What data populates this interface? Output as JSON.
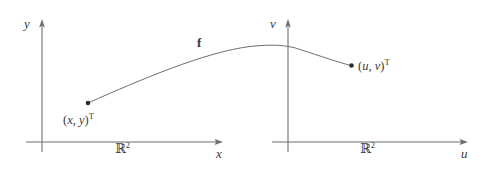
{
  "figure": {
    "type": "math-diagram",
    "title_text": "",
    "background_color": "#ffffff",
    "stroke_color": "#6e6e6e",
    "text_color": "#3a3a3a",
    "width": 489,
    "height": 169
  },
  "domain_plane": {
    "name": "domain-plane",
    "space_label": "ℝ",
    "space_exponent": "2",
    "vertical_axis_label": "y",
    "horizontal_axis_label": "x",
    "origin": {
      "x": 42,
      "y": 142
    },
    "point": {
      "label_open": "(",
      "var1": "x",
      "comma": ", ",
      "var2": "y",
      "label_close": ")",
      "transpose": "T",
      "x": 88,
      "y": 103
    }
  },
  "codomain_plane": {
    "name": "codomain-plane",
    "space_label": "ℝ",
    "space_exponent": "2",
    "vertical_axis_label": "v",
    "horizontal_axis_label": "u",
    "origin": {
      "x": 288,
      "y": 142
    },
    "point": {
      "label_open": "(",
      "var1": "u",
      "comma": ", ",
      "var2": "v",
      "label_close": ")",
      "transpose": "T",
      "x": 351,
      "y": 65
    }
  },
  "mapping": {
    "name": "mapping-curve",
    "label": "f",
    "from_point": {
      "x": 88,
      "y": 103
    },
    "to_point": {
      "x": 351,
      "y": 65
    },
    "peak": {
      "x": 292,
      "y": 46
    }
  }
}
